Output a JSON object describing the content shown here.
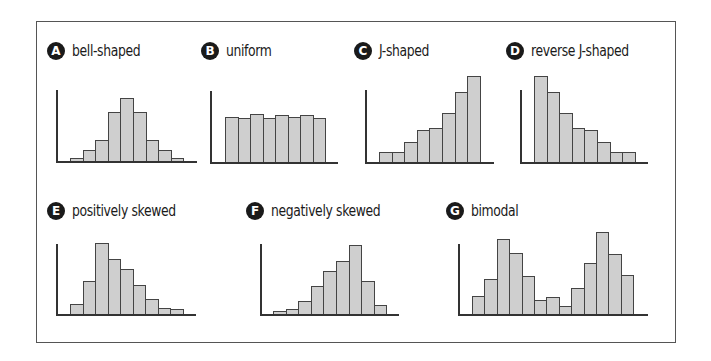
{
  "figure": {
    "panels": [
      {
        "letter": "A",
        "title": "bell-shaped"
      },
      {
        "letter": "B",
        "title": "uniform"
      },
      {
        "letter": "C",
        "title": "J-shaped"
      },
      {
        "letter": "D",
        "title": "reverse J-shaped"
      },
      {
        "letter": "E",
        "title": "positively skewed"
      },
      {
        "letter": "F",
        "title": "negatively skewed"
      },
      {
        "letter": "G",
        "title": "bimodal"
      }
    ]
  },
  "chart_data": [
    {
      "type": "bar",
      "title": "bell-shaped",
      "letter": "A",
      "values": [
        3,
        11,
        21,
        49,
        63,
        49,
        21,
        11,
        3
      ],
      "xlabel": "",
      "ylabel": "",
      "grid": false
    },
    {
      "type": "bar",
      "title": "uniform",
      "letter": "B",
      "values": [
        45,
        44,
        48,
        44,
        47,
        45,
        47,
        44
      ],
      "xlabel": "",
      "ylabel": "",
      "grid": false
    },
    {
      "type": "bar",
      "title": "J-shaped",
      "letter": "C",
      "values": [
        10,
        10,
        20,
        32,
        34,
        49,
        70,
        86
      ],
      "xlabel": "",
      "ylabel": "",
      "grid": false
    },
    {
      "type": "bar",
      "title": "reverse J-shaped",
      "letter": "D",
      "values": [
        86,
        70,
        49,
        34,
        32,
        20,
        10,
        10
      ],
      "xlabel": "",
      "ylabel": "",
      "grid": false
    },
    {
      "type": "bar",
      "title": "positively skewed",
      "letter": "E",
      "values": [
        10,
        33,
        71,
        55,
        45,
        29,
        15,
        6,
        5
      ],
      "xlabel": "",
      "ylabel": "",
      "grid": false
    },
    {
      "type": "bar",
      "title": "negatively skewed",
      "letter": "F",
      "values": [
        3,
        5,
        13,
        28,
        43,
        53,
        69,
        33,
        9
      ],
      "xlabel": "",
      "ylabel": "",
      "grid": false
    },
    {
      "type": "bar",
      "title": "bimodal",
      "letter": "G",
      "values": [
        18,
        35,
        75,
        61,
        38,
        14,
        17,
        8,
        26,
        51,
        82,
        60,
        39
      ],
      "xlabel": "",
      "ylabel": "",
      "grid": false
    }
  ]
}
